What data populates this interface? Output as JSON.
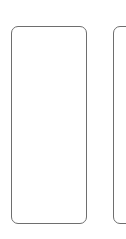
{
  "cards": [
    {
      "id": "left",
      "text": ""
    },
    {
      "id": "right",
      "text": ""
    }
  ],
  "colors": {
    "border": "#6e6e6e",
    "background": "#ffffff"
  }
}
